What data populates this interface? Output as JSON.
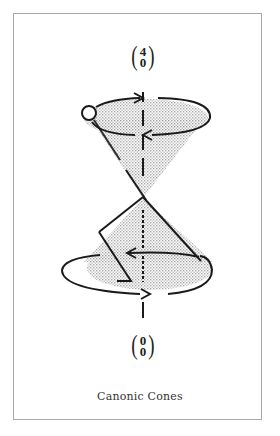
{
  "figure": {
    "caption": "Canonic Cones",
    "top_label": {
      "top": "4",
      "bottom": "0",
      "open": "(",
      "close": ")"
    },
    "bottom_label": {
      "top": "0",
      "bottom": "0",
      "open": "(",
      "close": ")"
    },
    "colors": {
      "stroke": "#1a1a1a",
      "shade": "#c8c8c8",
      "frame": "#a8a8a8",
      "background": "#ffffff"
    },
    "elements": [
      "vertical-dashed-axis",
      "upper-cone-shaded",
      "upper-ellipse-with-arrows",
      "small-circle-on-rim",
      "lower-cone-shaded",
      "lower-ellipse-with-arrows",
      "zigzag-path"
    ]
  }
}
